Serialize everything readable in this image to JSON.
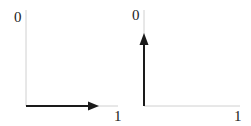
{
  "panels": [
    {
      "id": "left",
      "y_label": "0",
      "x_label": "1",
      "arrow_direction": "right",
      "arrow": {
        "x1": 26,
        "y1": 106,
        "x2": 100,
        "y2": 106
      }
    },
    {
      "id": "right",
      "y_label": "0",
      "x_label": "1",
      "arrow_direction": "up",
      "arrow": {
        "x1": 144,
        "y1": 106,
        "x2": 144,
        "y2": 33
      }
    }
  ],
  "colors": {
    "axis": "#d0d0d0",
    "arrow": "#1a1a1a",
    "label": "#222222",
    "background": "#ffffff"
  }
}
